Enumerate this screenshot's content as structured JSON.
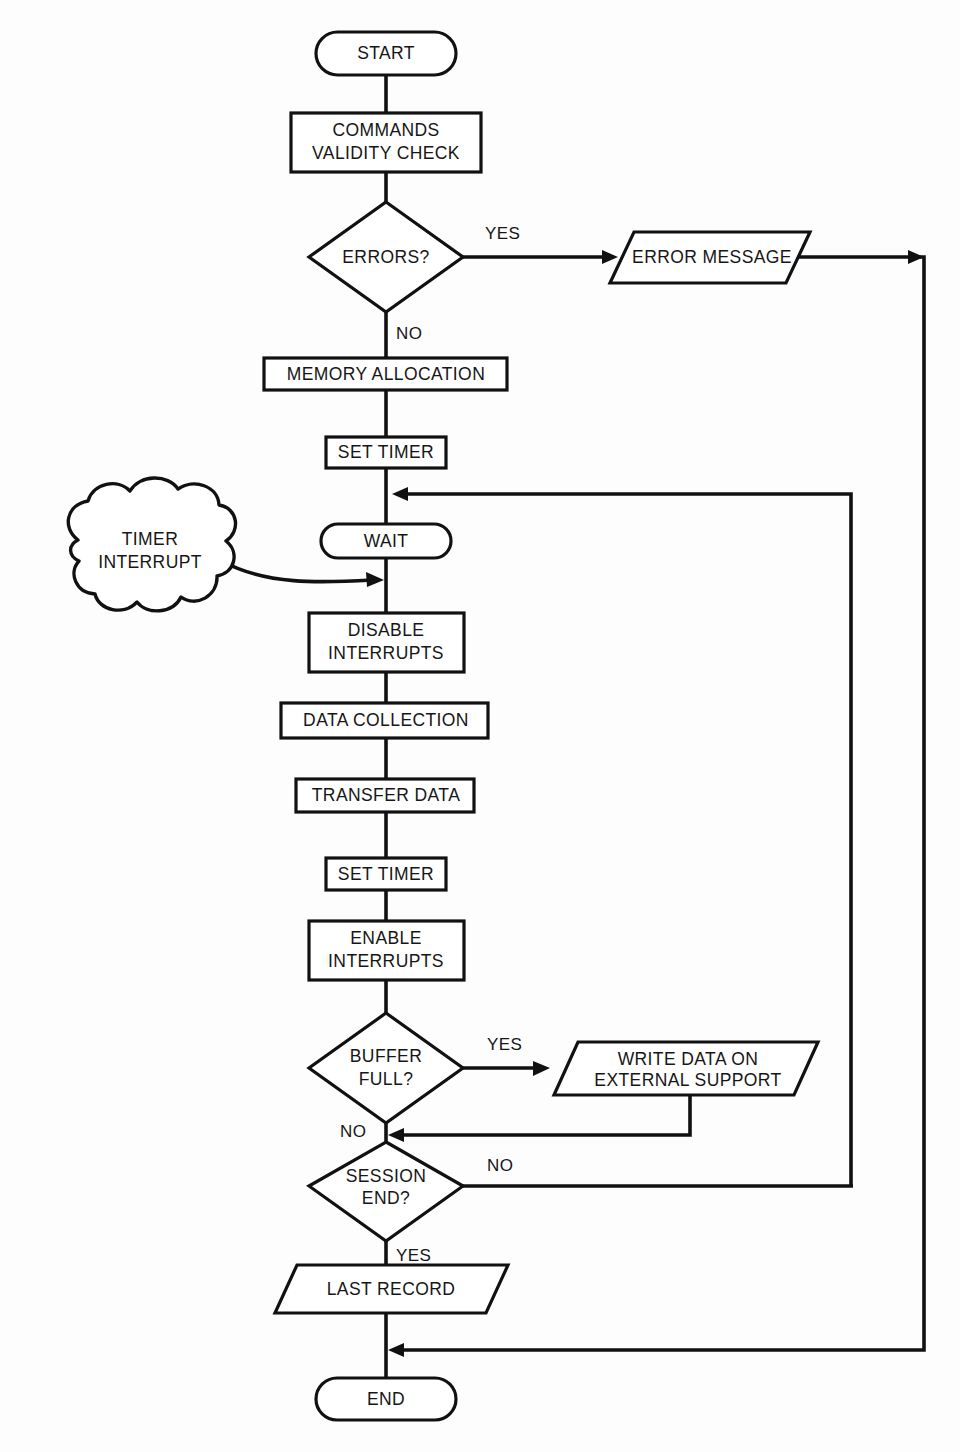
{
  "diagram": {
    "background_color": "#fdfdfd",
    "line_color": "#111111",
    "text_color": "#161616"
  },
  "nodes": {
    "start": {
      "label": "START",
      "shape": "terminator"
    },
    "commands_validity_check": {
      "label_line1": "COMMANDS",
      "label_line2": "VALIDITY CHECK",
      "shape": "process"
    },
    "errors": {
      "label": "ERRORS?",
      "shape": "decision"
    },
    "error_message": {
      "label": "ERROR MESSAGE",
      "shape": "io-parallelogram"
    },
    "memory_allocation": {
      "label": "MEMORY ALLOCATION",
      "shape": "process"
    },
    "set_timer_1": {
      "label": "SET TIMER",
      "shape": "process"
    },
    "wait": {
      "label": "WAIT",
      "shape": "terminator"
    },
    "timer_interrupt": {
      "label_line1": "TIMER",
      "label_line2": "INTERRUPT",
      "shape": "cloud"
    },
    "disable_interrupts": {
      "label_line1": "DISABLE",
      "label_line2": "INTERRUPTS",
      "shape": "process"
    },
    "data_collection": {
      "label": "DATA COLLECTION",
      "shape": "process"
    },
    "transfer_data": {
      "label": "TRANSFER DATA",
      "shape": "process"
    },
    "set_timer_2": {
      "label": "SET TIMER",
      "shape": "process"
    },
    "enable_interrupts": {
      "label_line1": "ENABLE",
      "label_line2": "INTERRUPTS",
      "shape": "process"
    },
    "buffer_full": {
      "label_line1": "BUFFER",
      "label_line2": "FULL?",
      "shape": "decision"
    },
    "write_data": {
      "label_line1": "WRITE DATA ON",
      "label_line2": "EXTERNAL SUPPORT",
      "shape": "io-parallelogram"
    },
    "session_end": {
      "label_line1": "SESSION",
      "label_line2": "END?",
      "shape": "decision"
    },
    "last_record": {
      "label": "LAST RECORD",
      "shape": "io-parallelogram"
    },
    "end": {
      "label": "END",
      "shape": "terminator"
    }
  },
  "edge_labels": {
    "errors_yes": "YES",
    "errors_no": "NO",
    "buffer_yes": "YES",
    "buffer_no": "NO",
    "session_no": "NO",
    "session_yes": "YES"
  }
}
